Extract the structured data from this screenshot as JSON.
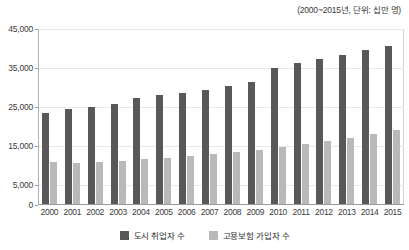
{
  "chart_data": {
    "type": "bar",
    "title": "",
    "subtitle": "(2000~2015년, 단위: 십만 명)",
    "xlabel": "",
    "ylabel": "",
    "categories": [
      "2000",
      "2001",
      "2002",
      "2003",
      "2004",
      "2005",
      "2006",
      "2007",
      "2008",
      "2009",
      "2010",
      "2011",
      "2012",
      "2013",
      "2014",
      "2015"
    ],
    "series": [
      {
        "name": "도시 취업자 수",
        "color": "#58585a",
        "values": [
          23300,
          24200,
          24900,
          25700,
          27000,
          27800,
          28300,
          29200,
          30200,
          31300,
          34900,
          36100,
          37200,
          38200,
          39300,
          40400
        ]
      },
      {
        "name": "고용보험 가입자 수",
        "color": "#b9b9b9",
        "values": [
          10800,
          10500,
          10700,
          10900,
          11400,
          11800,
          12300,
          12800,
          13400,
          13900,
          14600,
          15400,
          16200,
          17000,
          17900,
          18800
        ]
      }
    ],
    "ylim": [
      0,
      45000
    ],
    "yticks": [
      0,
      5000,
      15000,
      25000,
      35000,
      45000
    ],
    "ytick_labels": [
      "0",
      "5,000",
      "15,000",
      "25,000",
      "35,000",
      "45,000"
    ],
    "grid": true,
    "legend_position": "bottom"
  }
}
